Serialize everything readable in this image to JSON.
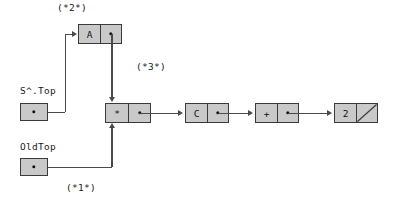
{
  "diagram": {
    "background_color": "#ffffff",
    "node_fill_color": "#c9c9c9",
    "node_border_color": "#3a3a3a",
    "connector_color": "#4a4a4a",
    "annotations": [
      {
        "id": "step2",
        "text": "(*2*)"
      },
      {
        "id": "step3",
        "text": "(*3*)"
      },
      {
        "id": "step1",
        "text": "(*1*)"
      }
    ],
    "variables": [
      {
        "id": "stop",
        "label": "S^.Top"
      },
      {
        "id": "oldtop",
        "label": "OldTop"
      }
    ],
    "nodes": [
      {
        "id": "node-a",
        "value": "A",
        "pointer": "dot"
      },
      {
        "id": "node-star",
        "value": "*",
        "pointer": "dot"
      },
      {
        "id": "node-c",
        "value": "C",
        "pointer": "dot"
      },
      {
        "id": "node-plus",
        "value": "+",
        "pointer": "dot"
      },
      {
        "id": "node-2",
        "value": "2",
        "pointer": "nil"
      }
    ]
  }
}
